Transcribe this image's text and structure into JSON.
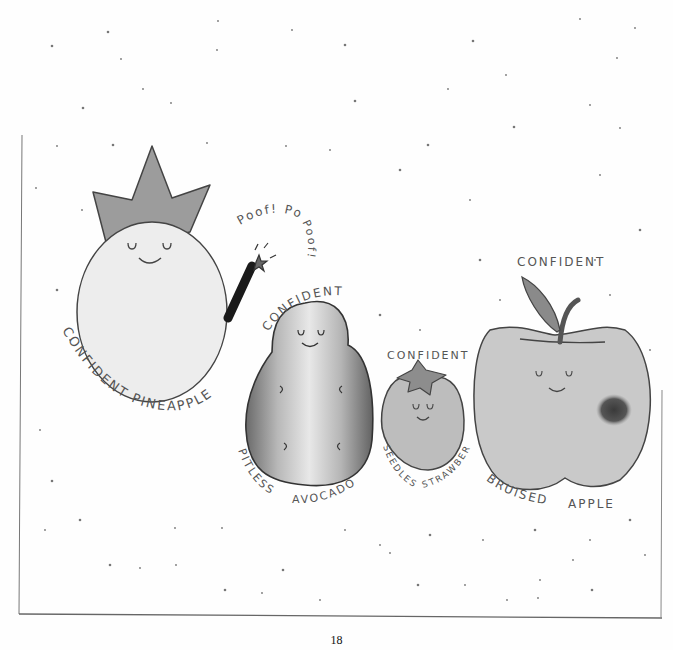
{
  "page": {
    "page_number": "18"
  },
  "illustration": {
    "characters": [
      {
        "id": "pineapple",
        "top_label": "",
        "bottom_label": "CONFIDENT PINEAPPLE",
        "accessory": "magic wand",
        "exclamations": [
          "Poof!",
          "Poof!",
          "Poof!"
        ]
      },
      {
        "id": "avocado",
        "top_label": "CONFIDENT",
        "bottom_label_left": "PITLESS",
        "bottom_label_right": "AVOCADO"
      },
      {
        "id": "strawberry",
        "top_label": "CONFIDENT",
        "bottom_label_left": "SEEDLESS",
        "bottom_label_right": "STRAWBERRY"
      },
      {
        "id": "apple",
        "top_label": "CONFIDENT",
        "bottom_label_left": "BRUISED",
        "bottom_label_right": "APPLE"
      }
    ]
  }
}
